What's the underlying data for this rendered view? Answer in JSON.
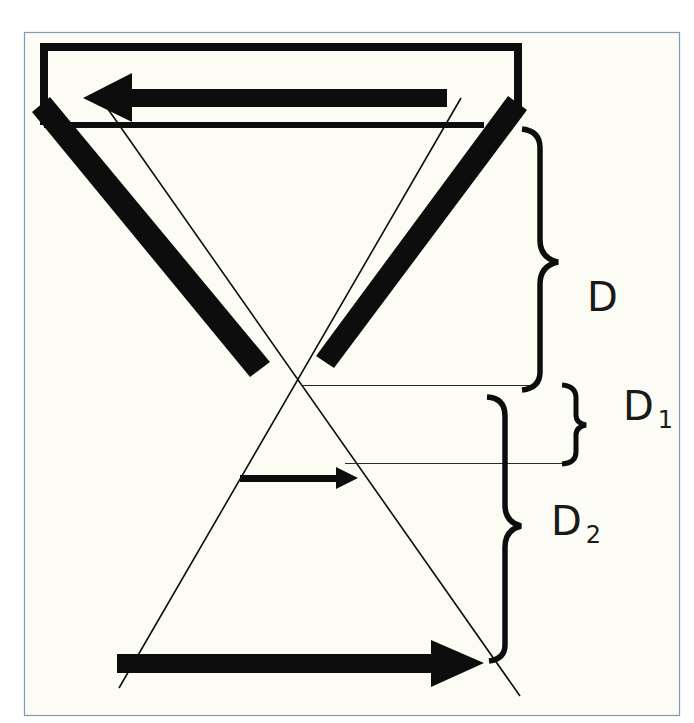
{
  "diagram": {
    "type": "optics-ray-diagram",
    "colors": {
      "background": "#fdfcf4",
      "frame_border": "#7f9bb8",
      "ink": "#0d0d0d"
    },
    "labels": {
      "d": "D",
      "d1_main": "D",
      "d1_sub": "1",
      "d2_main": "D",
      "d2_sub": "2"
    },
    "elements": {
      "top_box": "rectangular frame at top",
      "top_arrow": "left-pointing thick arrow (object)",
      "left_bar": "left thick diagonal bar",
      "right_bar": "right thick diagonal bar",
      "ray_1": "thin ray from upper-left to lower-right",
      "ray_2": "thin ray from upper-right to lower-left",
      "middle_arrow": "small right-pointing arrow (image at D1)",
      "bottom_arrow": "large right-pointing arrow (image at D2)",
      "bracket_d": "brace spanning distance D",
      "bracket_d1": "brace spanning distance D1",
      "bracket_d2": "brace spanning distance D2"
    }
  }
}
